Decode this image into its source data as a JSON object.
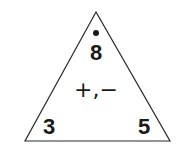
{
  "fact_triangle": {
    "top_number": "8",
    "left_number": "3",
    "right_number": "5",
    "operations": "+,−",
    "marker": "dot",
    "stroke_color": "#2a2a2a",
    "text_color": "#1a1a1a",
    "background": "#ffffff"
  }
}
